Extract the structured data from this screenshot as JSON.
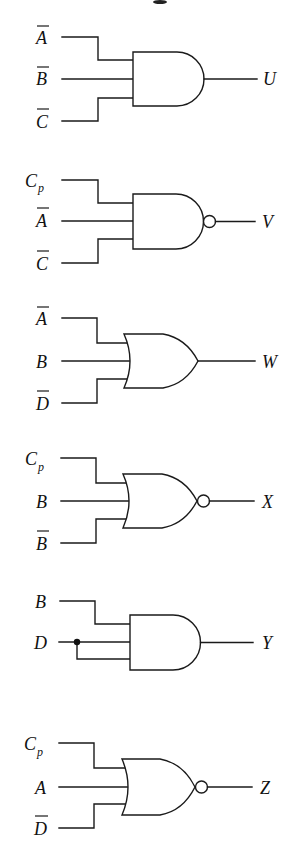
{
  "diagram": {
    "type": "logic-gate-circuits",
    "colors": {
      "line": "#1a1a1a",
      "background": "#ffffff"
    },
    "gates": [
      {
        "id": "U",
        "gate_type": "AND",
        "inverted_output": false,
        "output_label": "U",
        "inputs": [
          {
            "name": "A",
            "subscript": "",
            "negated": true
          },
          {
            "name": "B",
            "subscript": "",
            "negated": true
          },
          {
            "name": "C",
            "subscript": "",
            "negated": true
          }
        ]
      },
      {
        "id": "V",
        "gate_type": "NAND",
        "inverted_output": true,
        "output_label": "V",
        "inputs": [
          {
            "name": "C",
            "subscript": "p",
            "negated": false
          },
          {
            "name": "A",
            "subscript": "",
            "negated": true
          },
          {
            "name": "C",
            "subscript": "",
            "negated": true
          }
        ]
      },
      {
        "id": "W",
        "gate_type": "OR",
        "inverted_output": false,
        "output_label": "W",
        "inputs": [
          {
            "name": "A",
            "subscript": "",
            "negated": true
          },
          {
            "name": "B",
            "subscript": "",
            "negated": false
          },
          {
            "name": "D",
            "subscript": "",
            "negated": true
          }
        ]
      },
      {
        "id": "X",
        "gate_type": "NOR",
        "inverted_output": true,
        "output_label": "X",
        "inputs": [
          {
            "name": "C",
            "subscript": "p",
            "negated": false
          },
          {
            "name": "B",
            "subscript": "",
            "negated": false
          },
          {
            "name": "B",
            "subscript": "",
            "negated": true
          }
        ]
      },
      {
        "id": "Y",
        "gate_type": "AND",
        "inverted_output": false,
        "output_label": "Y",
        "note": "D input tied to two gate inputs via junction dot",
        "inputs": [
          {
            "name": "B",
            "subscript": "",
            "negated": false
          },
          {
            "name": "D",
            "subscript": "",
            "negated": false
          }
        ]
      },
      {
        "id": "Z",
        "gate_type": "NOR",
        "inverted_output": true,
        "output_label": "Z",
        "inputs": [
          {
            "name": "C",
            "subscript": "p",
            "negated": false
          },
          {
            "name": "A",
            "subscript": "",
            "negated": false
          },
          {
            "name": "D",
            "subscript": "",
            "negated": true
          }
        ]
      }
    ]
  },
  "labels": {
    "g1": {
      "in1": "A",
      "in2": "B",
      "in3": "C",
      "out": "U"
    },
    "g2": {
      "in1": "C",
      "in1_sub": "p",
      "in2": "A",
      "in3": "C",
      "out": "V"
    },
    "g3": {
      "in1": "A",
      "in2": "B",
      "in3": "D",
      "out": "W"
    },
    "g4": {
      "in1": "C",
      "in1_sub": "p",
      "in2": "B",
      "in3": "B",
      "out": "X"
    },
    "g5": {
      "in1": "B",
      "in2": "D",
      "out": "Y"
    },
    "g6": {
      "in1": "C",
      "in1_sub": "p",
      "in2": "A",
      "in3": "D",
      "out": "Z"
    }
  }
}
